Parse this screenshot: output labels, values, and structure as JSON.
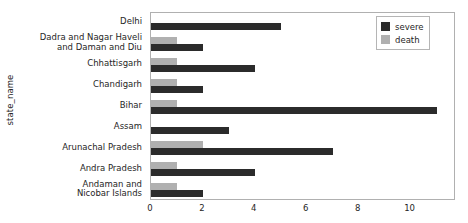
{
  "chart_data": {
    "type": "bar",
    "orientation": "horizontal",
    "title": "",
    "xlabel": "",
    "ylabel": "state_name",
    "xlim": [
      0,
      11.75
    ],
    "ylim": [
      0,
      9
    ],
    "grid": false,
    "xticks": [
      0,
      2,
      4,
      6,
      8,
      10
    ],
    "xtick_labels": [
      "0",
      "2",
      "4",
      "6",
      "8",
      "10"
    ],
    "categories": [
      "Delhi",
      "Dadra and Nagar Haveli\nand Daman and Diu",
      "Chhattisgarh",
      "Chandigarh",
      "Bihar",
      "Assam",
      "Arunachal Pradesh",
      "Andra Pradesh",
      "Andaman and\nNicobar Islands"
    ],
    "series": [
      {
        "name": "severe",
        "color": "#2b2b2b",
        "values": [
          5,
          2,
          4,
          2,
          11,
          3,
          7,
          4,
          2
        ]
      },
      {
        "name": "death",
        "color": "#b0b0b0",
        "values": [
          0,
          1,
          1,
          1,
          1,
          0,
          2,
          1,
          1
        ]
      }
    ],
    "legend": {
      "position": "upper right",
      "entries": [
        "severe",
        "death"
      ]
    }
  },
  "axes": {
    "frame_color": "#b0b0b0",
    "tick_color": "#555555",
    "text_color": "#262626"
  }
}
